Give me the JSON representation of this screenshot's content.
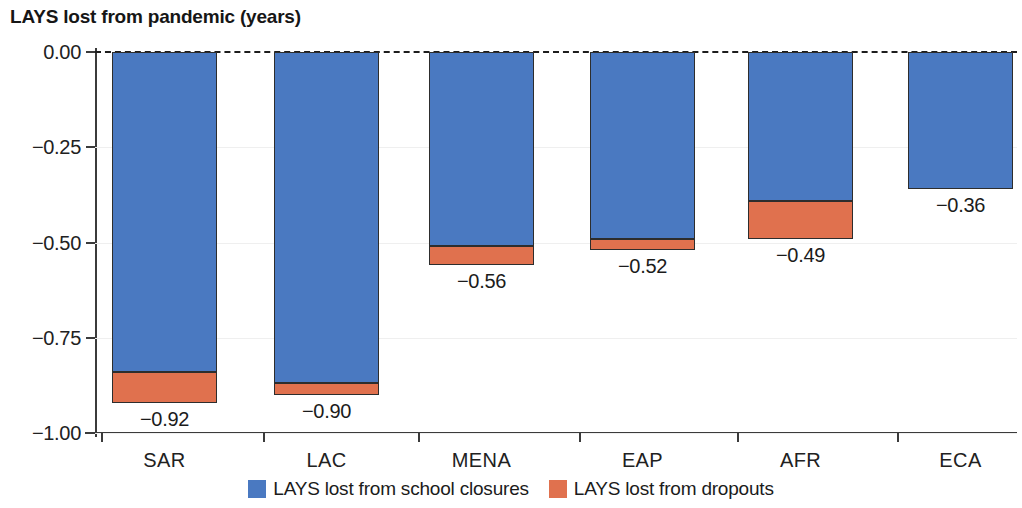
{
  "chart_data": {
    "type": "bar",
    "title": "LAYS lost from pandemic (years)",
    "xlabel": "",
    "ylabel": "",
    "stacked": true,
    "orientation": "vertical",
    "grid": false,
    "ylim": [
      -1.0,
      0.0
    ],
    "yticks": [
      "0.00",
      "-0.25",
      "-0.50",
      "-0.75",
      "-1.00"
    ],
    "ytick_values": [
      0.0,
      -0.25,
      -0.5,
      -0.75,
      -1.0
    ],
    "categories": [
      "SAR",
      "LAC",
      "MENA",
      "EAP",
      "AFR",
      "ECA"
    ],
    "series": [
      {
        "name": "LAYS lost from school closures",
        "color": "#4a79c1",
        "values": [
          -0.84,
          -0.87,
          -0.51,
          -0.49,
          -0.39,
          -0.36
        ]
      },
      {
        "name": "LAYS lost from dropouts",
        "color": "#e0714e",
        "values": [
          -0.08,
          -0.03,
          -0.05,
          -0.03,
          -0.1,
          0.0
        ]
      }
    ],
    "totals": [
      -0.92,
      -0.9,
      -0.56,
      -0.52,
      -0.49,
      -0.36
    ],
    "data_labels": [
      "-0.92",
      "-0.90",
      "-0.56",
      "-0.52",
      "-0.49",
      "-0.36"
    ],
    "legend_position": "bottom",
    "zero_line": "dashed"
  },
  "legend": {
    "items": [
      {
        "label": "LAYS lost from school closures",
        "color": "#4a79c1"
      },
      {
        "label": "LAYS lost from dropouts",
        "color": "#e0714e"
      }
    ]
  }
}
